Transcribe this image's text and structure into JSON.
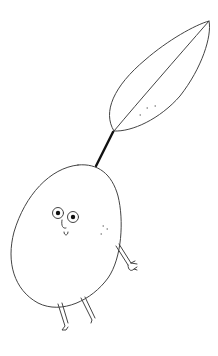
{
  "illustration": {
    "subject": "cartoon olive character with leaf",
    "background_color": "#ffffff",
    "stroke_color": "#333333",
    "stem_color": "#111111",
    "pupil_color": "#111111",
    "parts": [
      "leaf",
      "stem",
      "body",
      "eyes",
      "nose",
      "mouth",
      "cheek-freckles",
      "arm",
      "hand",
      "legs"
    ]
  }
}
